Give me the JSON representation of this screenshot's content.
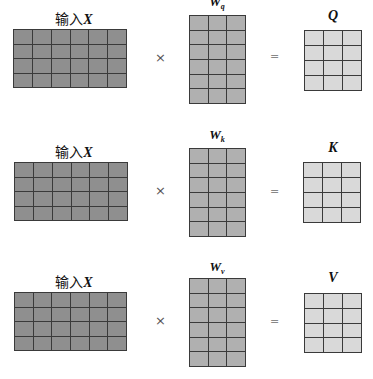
{
  "colors": {
    "input": "#8f8f8f",
    "weight": "#b0b0b0",
    "output": "#d9d9d9",
    "grid_line": "#3a3a3a"
  },
  "operators": {
    "multiply": "×",
    "equals": "="
  },
  "rows": [
    {
      "input": {
        "label_prefix": "输入",
        "label_var": "X",
        "rows": 4,
        "cols": 6
      },
      "weight": {
        "label_var": "W",
        "label_sub": "q",
        "rows": 6,
        "cols": 3
      },
      "output": {
        "label_var": "Q",
        "rows": 4,
        "cols": 3
      }
    },
    {
      "input": {
        "label_prefix": "输入",
        "label_var": "X",
        "rows": 4,
        "cols": 6
      },
      "weight": {
        "label_var": "W",
        "label_sub": "k",
        "rows": 6,
        "cols": 3
      },
      "output": {
        "label_var": "K",
        "rows": 4,
        "cols": 3
      }
    },
    {
      "input": {
        "label_prefix": "输入",
        "label_var": "X",
        "rows": 4,
        "cols": 6
      },
      "weight": {
        "label_var": "W",
        "label_sub": "v",
        "rows": 6,
        "cols": 3
      },
      "output": {
        "label_var": "V",
        "rows": 4,
        "cols": 3
      }
    }
  ]
}
